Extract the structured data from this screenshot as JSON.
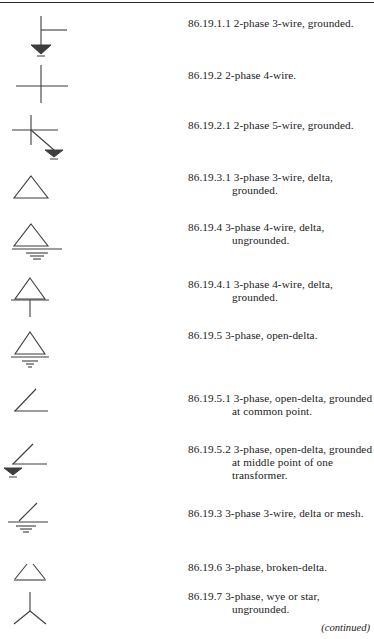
{
  "document": {
    "top_rule": true,
    "continued_note": "(continued)"
  },
  "table": {
    "rows": [
      {
        "symbol": "cross-tee-with-ground-arrow",
        "number": "86.19.1.1",
        "description": "2-phase 3-wire, grounded."
      },
      {
        "symbol": "plain-cross",
        "number": "86.19.2",
        "description": "2-phase 4-wire."
      },
      {
        "symbol": "cross-with-diagonal-ground-arrow",
        "number": "86.19.2.1",
        "description": "2-phase 5-wire, grounded."
      },
      {
        "symbol": "delta-triangle",
        "number": "86.19.3.1",
        "description": "3-phase 3-wire, delta, grounded."
      },
      {
        "symbol": "delta-triangle-with-base-ground-stack",
        "number": "86.19.4",
        "description": "3-phase 4-wire, delta, ungrounded."
      },
      {
        "symbol": "delta-triangle-with-stem",
        "number": "86.19.4.1",
        "description": "3-phase 4-wire, delta, grounded."
      },
      {
        "symbol": "delta-triangle-with-ground-stack",
        "number": "86.19.5",
        "description": "3-phase, open-delta."
      },
      {
        "symbol": "open-delta-angle",
        "number": "86.19.5.1",
        "description": "3-phase, open-delta, grounded at common point."
      },
      {
        "symbol": "open-delta-angle-with-vertex-ground",
        "number": "86.19.5.2",
        "description": "3-phase, open-delta, grounded at middle point of one transformer."
      },
      {
        "symbol": "open-delta-angle-with-ground-stack",
        "number": "86.19.3",
        "description": "3-phase 3-wire, delta or mesh."
      },
      {
        "symbol": "broken-delta-triangle",
        "number": "86.19.6",
        "description": "3-phase, broken-delta."
      },
      {
        "symbol": "wye-star-three-spoke",
        "number": "86.19.7",
        "description": "3-phase, wye or star, ungrounded."
      }
    ]
  }
}
